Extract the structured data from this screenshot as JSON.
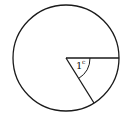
{
  "diagram": {
    "title": "",
    "shape": "circle",
    "angle_label": {
      "value": "1",
      "unit": "c"
    },
    "stroke_color": "#1a1a1a",
    "background": "#ffffff"
  }
}
